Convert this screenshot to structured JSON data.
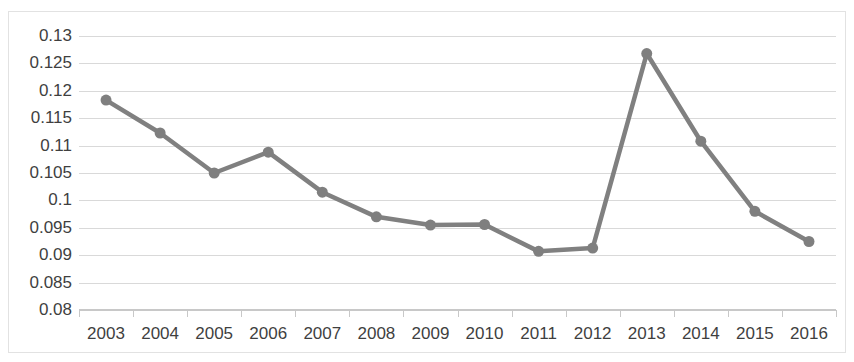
{
  "chart_data": {
    "type": "line",
    "title": "",
    "subtitle": "",
    "xlabel": "",
    "ylabel": "",
    "categories": [
      "2003",
      "2004",
      "2005",
      "2006",
      "2007",
      "2008",
      "2009",
      "2010",
      "2011",
      "2012",
      "2013",
      "2014",
      "2015",
      "2016"
    ],
    "series": [
      {
        "name": "",
        "values": [
          0.1183,
          0.1123,
          0.105,
          0.1088,
          0.1015,
          0.097,
          0.0955,
          0.0956,
          0.0907,
          0.0913,
          0.1268,
          0.1108,
          0.098,
          0.0925
        ]
      }
    ],
    "ylim": [
      0.08,
      0.13
    ],
    "ytick_values": [
      0.13,
      0.125,
      0.12,
      0.115,
      0.11,
      0.105,
      0.1,
      0.095,
      0.09,
      0.085,
      0.08
    ],
    "ytick_labels": [
      "0.13",
      "0.125",
      "0.12",
      "0.115",
      "0.11",
      "0.105",
      "0.1",
      "0.095",
      "0.09",
      "0.085",
      "0.08"
    ],
    "grid": true,
    "legend": "none",
    "marker": "circle",
    "colors": {
      "line": "#808080",
      "marker": "#7f7f7f",
      "gridline": "#d9d9d9",
      "axis": "#c8c8c8",
      "text": "#3f3f3f",
      "border": "#e2e2e2",
      "background": "#ffffff"
    }
  }
}
